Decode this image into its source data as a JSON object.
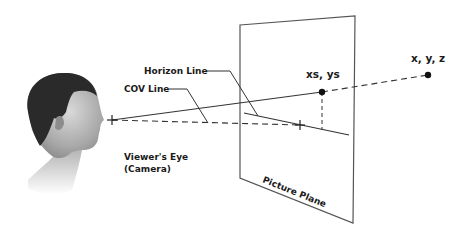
{
  "diagram": {
    "labels": {
      "horizon_line": "Horizon Line",
      "cov_line": "COV Line",
      "viewers_eye_line1": "Viewer's Eye",
      "viewers_eye_line2": "(Camera)",
      "screen_point": "xs, ys",
      "world_point": "x, y, z",
      "picture_plane": "Picture Plane"
    },
    "elements": {
      "viewer": "head-profile-illustration",
      "eye_marker": "cross-marker",
      "center_marker": "cross-marker",
      "screen_point_marker": "dot",
      "world_point_marker": "dot"
    },
    "colors": {
      "line": "#333333",
      "plane_edge": "#555555",
      "text": "#1a1a1a",
      "background": "#ffffff"
    }
  }
}
